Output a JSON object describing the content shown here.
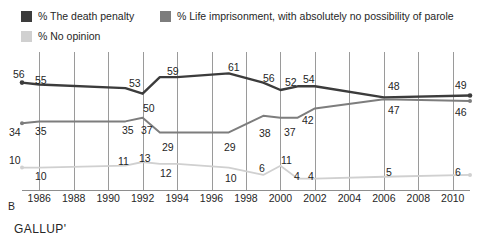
{
  "legend": {
    "items": [
      {
        "label": "% The death penalty",
        "color": "#3c3c3c",
        "key": "death_penalty"
      },
      {
        "label": "% Life imprisonment, with absolutely no possibility of parole",
        "color": "#7d7d7d",
        "key": "life_imprisonment"
      },
      {
        "label": "% No opinion",
        "color": "#d0d0d0",
        "key": "no_opinion"
      }
    ]
  },
  "axis": {
    "x_ticks": [
      "1986",
      "1988",
      "1990",
      "1992",
      "1994",
      "1996",
      "1998",
      "2000",
      "2002",
      "2004",
      "2006",
      "2008",
      "2010"
    ],
    "corner_marker": "B"
  },
  "source": "GALLUP'",
  "chart_data": {
    "type": "line",
    "title": "",
    "subtitle": "",
    "xlabel": "",
    "ylabel": "",
    "xlim": [
      1985,
      2011
    ],
    "ylim": [
      0,
      65
    ],
    "grid": "vertical-only",
    "legend_position": "top",
    "x": [
      1985,
      1986,
      1991,
      1992,
      1993,
      1994,
      1997,
      1999,
      2000,
      2001,
      2002,
      2006,
      2011
    ],
    "series": [
      {
        "name": "% The death penalty",
        "color": "#3c3c3c",
        "values": [
          56,
          55,
          53,
          50,
          59,
          59,
          61,
          56,
          52,
          54,
          54,
          48,
          49
        ],
        "labels": [
          "56",
          "55",
          "53",
          "50",
          "59",
          "",
          "61",
          "56",
          "52",
          "54",
          "",
          "48",
          "49"
        ]
      },
      {
        "name": "% Life imprisonment, with absolutely no possibility of parole",
        "color": "#7d7d7d",
        "values": [
          34,
          35,
          35,
          37,
          29,
          29,
          29,
          38,
          37,
          37,
          42,
          47,
          46
        ],
        "labels": [
          "34",
          "35",
          "35",
          "37",
          "29",
          "",
          "29",
          "38",
          "37",
          "",
          "42",
          "47",
          "46"
        ]
      },
      {
        "name": "% No opinion",
        "color": "#d0d0d0",
        "values": [
          10,
          10,
          11,
          13,
          12,
          12,
          10,
          6,
          11,
          4,
          4,
          5,
          6
        ],
        "labels": [
          "10",
          "10",
          "11",
          "13",
          "12",
          "",
          "10",
          "6",
          "11",
          "4",
          "4",
          "5",
          "6"
        ]
      }
    ],
    "point_labels": {
      "death_penalty": [
        {
          "text": "56",
          "x": 13,
          "y": 69
        },
        {
          "text": "55",
          "x": 35,
          "y": 75
        },
        {
          "text": "53",
          "x": 129,
          "y": 78
        },
        {
          "text": "50",
          "x": 143,
          "y": 103
        },
        {
          "text": "59",
          "x": 167,
          "y": 66
        },
        {
          "text": "61",
          "x": 228,
          "y": 62
        },
        {
          "text": "56",
          "x": 263,
          "y": 73
        },
        {
          "text": "52",
          "x": 285,
          "y": 77
        },
        {
          "text": "54",
          "x": 303,
          "y": 74
        },
        {
          "text": "48",
          "x": 388,
          "y": 81
        },
        {
          "text": "49",
          "x": 455,
          "y": 80
        }
      ],
      "life_imprisonment": [
        {
          "text": "34",
          "x": 9,
          "y": 127
        },
        {
          "text": "35",
          "x": 35,
          "y": 126
        },
        {
          "text": "35",
          "x": 122,
          "y": 125
        },
        {
          "text": "37",
          "x": 141,
          "y": 125
        },
        {
          "text": "29",
          "x": 162,
          "y": 142
        },
        {
          "text": "29",
          "x": 224,
          "y": 142
        },
        {
          "text": "38",
          "x": 259,
          "y": 128
        },
        {
          "text": "37",
          "x": 284,
          "y": 127
        },
        {
          "text": "42",
          "x": 302,
          "y": 115
        },
        {
          "text": "47",
          "x": 388,
          "y": 105
        },
        {
          "text": "46",
          "x": 455,
          "y": 107
        }
      ],
      "no_opinion": [
        {
          "text": "10",
          "x": 9,
          "y": 155
        },
        {
          "text": "10",
          "x": 35,
          "y": 171
        },
        {
          "text": "11",
          "x": 118,
          "y": 156
        },
        {
          "text": "13",
          "x": 139,
          "y": 153
        },
        {
          "text": "12",
          "x": 160,
          "y": 168
        },
        {
          "text": "10",
          "x": 225,
          "y": 173
        },
        {
          "text": "6",
          "x": 259,
          "y": 163
        },
        {
          "text": "11",
          "x": 281,
          "y": 155
        },
        {
          "text": "4",
          "x": 294,
          "y": 171
        },
        {
          "text": "4",
          "x": 308,
          "y": 171
        },
        {
          "text": "5",
          "x": 386,
          "y": 167
        },
        {
          "text": "6",
          "x": 455,
          "y": 167
        }
      ]
    }
  }
}
